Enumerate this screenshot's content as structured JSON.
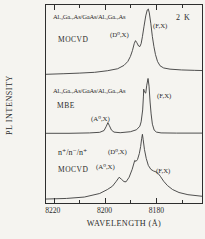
{
  "figure": {
    "temperature": "2 K",
    "ylabel": "PL INTENSITY",
    "xlabel": "WAVELENGTH (Å)",
    "panel1": {
      "sample": "Al.₃Ga.₇As/GaAs/Al.₃Ga.₇As",
      "method": "MOCVD",
      "label_d0x": "(D⁰,X)",
      "label_fx": "(F,X)"
    },
    "panel2": {
      "sample": "Al.₃Ga.₇As/GaAs/Al.₃Ga.₇As",
      "method": "MBE",
      "label_a0x": "(A⁰,X)",
      "label_fx": "(F,X)"
    },
    "panel3": {
      "sample": "n⁺/n⁻/n⁺",
      "method": "MOCVD",
      "label_d0x": "(D⁰,X)",
      "label_a0x": "(A⁰,X)",
      "label_fx": "(F,X)"
    }
  },
  "chart_data": {
    "type": "line",
    "title": "",
    "xlabel": "WAVELENGTH (Å)",
    "ylabel": "PL INTENSITY",
    "annotations": [
      "2 K"
    ],
    "x_axis": {
      "min": 8162,
      "max": 8223,
      "reversed": true,
      "unit": "Å",
      "major_ticks": [
        8220,
        8200,
        8180
      ],
      "minor_ticks": [
        8210,
        8190,
        8170
      ]
    },
    "y_axis": {
      "min": 0,
      "max": 100,
      "unit": "arbitrary units",
      "ticks_visible": false
    },
    "legend": "none",
    "grid": false,
    "series": [
      {
        "name": "Al.3Ga.7As/GaAs/Al.3Ga.7As MOCVD",
        "peaks": [
          {
            "label": "(D⁰,X)",
            "wavelength": 8188
          },
          {
            "label": "(F,X)",
            "wavelength": 8183
          }
        ],
        "points": [
          [
            8223,
            65
          ],
          [
            8216,
            65.3
          ],
          [
            8210,
            65.6
          ],
          [
            8204,
            66
          ],
          [
            8199,
            66.8
          ],
          [
            8195,
            67.8
          ],
          [
            8192.5,
            69.5
          ],
          [
            8191,
            71.5
          ],
          [
            8190,
            74
          ],
          [
            8189.2,
            77
          ],
          [
            8188.5,
            80.5
          ],
          [
            8188,
            82
          ],
          [
            8187.5,
            81
          ],
          [
            8186.8,
            79.3
          ],
          [
            8186.3,
            79
          ],
          [
            8185.8,
            80.5
          ],
          [
            8185.3,
            84
          ],
          [
            8184.7,
            89
          ],
          [
            8184,
            94.5
          ],
          [
            8183.4,
            97.5
          ],
          [
            8183,
            98
          ],
          [
            8182.6,
            96
          ],
          [
            8182,
            90.5
          ],
          [
            8181.4,
            84
          ],
          [
            8180.8,
            79
          ],
          [
            8180.2,
            75
          ],
          [
            8179.4,
            71.5
          ],
          [
            8178.4,
            69.3
          ],
          [
            8177,
            68.2
          ],
          [
            8174.5,
            67.6
          ],
          [
            8170,
            67.2
          ],
          [
            8165,
            67
          ],
          [
            8162,
            66.9
          ]
        ]
      },
      {
        "name": "Al.3Ga.7As/GaAs/Al.3Ga.7As MBE",
        "peaks": [
          {
            "label": "(A⁰,X)",
            "wavelength": 8198.8
          },
          {
            "label": "(F,X)",
            "wavelength": 8183.1
          }
        ],
        "points": [
          [
            8223,
            35.2
          ],
          [
            8214,
            35.2
          ],
          [
            8206,
            35.4
          ],
          [
            8202,
            35.7
          ],
          [
            8200.3,
            36.6
          ],
          [
            8199.4,
            38.8
          ],
          [
            8198.8,
            40.6
          ],
          [
            8198.2,
            39
          ],
          [
            8197.4,
            36.8
          ],
          [
            8196.4,
            35.8
          ],
          [
            8194,
            35.5
          ],
          [
            8190,
            36
          ],
          [
            8187.6,
            37
          ],
          [
            8186.3,
            38.8
          ],
          [
            8185.8,
            41
          ],
          [
            8185.2,
            47
          ],
          [
            8184.9,
            54
          ],
          [
            8184.8,
            57.5
          ],
          [
            8184.5,
            56
          ],
          [
            8184.0,
            55.5
          ],
          [
            8183.6,
            59.5
          ],
          [
            8183.1,
            62.9
          ],
          [
            8182.7,
            59
          ],
          [
            8182.3,
            51
          ],
          [
            8181.9,
            45
          ],
          [
            8181.4,
            39.8
          ],
          [
            8180.7,
            36.8
          ],
          [
            8179.8,
            35.8
          ],
          [
            8178,
            35.4
          ],
          [
            8172,
            35.3
          ],
          [
            8162,
            35.3
          ]
        ]
      },
      {
        "name": "n+/n-/n+ MOCVD",
        "peaks": [
          {
            "label": "(A⁰,X)",
            "wavelength": 8194.4
          },
          {
            "label": "(D⁰,X)",
            "wavelength": 8185.3
          },
          {
            "label": "(F,X)",
            "wavelength": 8180
          }
        ],
        "points": [
          [
            8223,
            2
          ],
          [
            8215,
            2.3
          ],
          [
            8208,
            3
          ],
          [
            8202,
            4.8
          ],
          [
            8199,
            6.8
          ],
          [
            8197,
            8.5
          ],
          [
            8195.5,
            11
          ],
          [
            8194.4,
            13
          ],
          [
            8193.5,
            12
          ],
          [
            8192.5,
            10.8
          ],
          [
            8191.7,
            10.7
          ],
          [
            8190.5,
            13
          ],
          [
            8189.3,
            17
          ],
          [
            8188.3,
            21.5
          ],
          [
            8187.8,
            21
          ],
          [
            8187.2,
            22
          ],
          [
            8186.5,
            25
          ],
          [
            8186,
            28.5
          ],
          [
            8185.6,
            32.5
          ],
          [
            8185.3,
            34.7
          ],
          [
            8185,
            32
          ],
          [
            8184.5,
            27
          ],
          [
            8183.8,
            22.5
          ],
          [
            8183,
            19
          ],
          [
            8182,
            17
          ],
          [
            8181,
            16.2
          ],
          [
            8180,
            15.7
          ],
          [
            8179.2,
            15
          ],
          [
            8178.3,
            13.5
          ],
          [
            8177,
            11
          ],
          [
            8175.5,
            8.8
          ],
          [
            8173.5,
            6.8
          ],
          [
            8171,
            5.3
          ],
          [
            8167.5,
            4.2
          ],
          [
            8162,
            3.4
          ]
        ]
      }
    ]
  }
}
